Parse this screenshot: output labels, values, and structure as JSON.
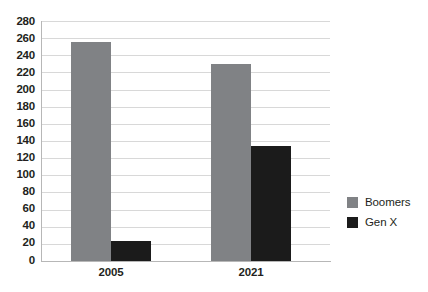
{
  "chart_data": {
    "type": "bar",
    "title": "",
    "subtitle": "",
    "xlabel": "",
    "ylabel": "",
    "categories": [
      "2005",
      "2021"
    ],
    "series": [
      {
        "name": "Boomers",
        "values": [
          255,
          230
        ],
        "color": "#808285"
      },
      {
        "name": "Gen X",
        "values": [
          23,
          134
        ],
        "color": "#1b1b1b"
      }
    ],
    "ylim": [
      0,
      280
    ],
    "ytick_step": 20,
    "yticks": [
      280,
      260,
      240,
      220,
      200,
      180,
      160,
      140,
      120,
      100,
      80,
      60,
      40,
      20,
      0
    ],
    "ytick_labels": [
      "280",
      "260",
      "240",
      "220",
      "200",
      "180",
      "160",
      "140",
      "120",
      "100",
      "80",
      "60",
      "40",
      "20",
      "0"
    ],
    "grid": true,
    "grid_axis": "y",
    "legend_position": "right",
    "legend_entries": [
      {
        "label": "Boomers",
        "color": "#808285",
        "swatch": "legend-swatch-boomers"
      },
      {
        "label": "Gen X",
        "color": "#1b1b1b",
        "swatch": "legend-swatch-genx"
      }
    ],
    "background_color": "#ffffff",
    "axis_color": "#b7b7b7",
    "grid_color": "#d8d8d8",
    "text_color": "#231f20"
  },
  "legend": {
    "boomers_label": "Boomers",
    "genx_label": "Gen X"
  },
  "axis": {
    "category_2005": "2005",
    "category_2021": "2021"
  }
}
